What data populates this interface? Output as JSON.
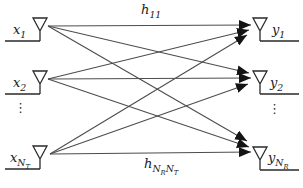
{
  "figure": {
    "type": "mimo-channel-diagram"
  },
  "colors": {
    "background": "#ffffff",
    "channel_line": "#4d4d4d",
    "arrowhead": "#141414",
    "antenna_ink": "#2a2a2a",
    "text": "#1a1a1a"
  },
  "labels": {
    "tx1": {
      "main": "x",
      "s1": "1"
    },
    "tx2": {
      "main": "x",
      "s1": "2"
    },
    "tx3": {
      "main": "x",
      "s1": "N",
      "s1s": "T"
    },
    "rx1": {
      "main": "y",
      "s1": "1"
    },
    "rx2": {
      "main": "y",
      "s1": "2"
    },
    "rx3": {
      "main": "y",
      "s1": "N",
      "s1s": "R"
    },
    "h11": {
      "main": "h",
      "s1": "11"
    },
    "hNRNT": {
      "main": "h",
      "s1": "N",
      "s1s": "R",
      "s2": "N",
      "s2s": "T"
    }
  },
  "ellipsis": {
    "left": "⋮",
    "right": "⋮"
  }
}
